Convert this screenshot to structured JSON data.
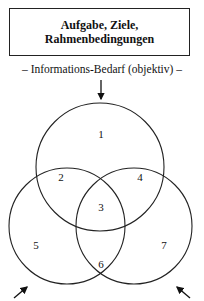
{
  "header_box": {
    "line1": "Aufgabe, Ziele,",
    "line2": "Rahmenbedingungen"
  },
  "subtitle": "– Informations-Bedarf (objektiv) –",
  "venn": {
    "regions": [
      "1",
      "2",
      "3",
      "4",
      "5",
      "6",
      "7"
    ],
    "circles": [
      "top",
      "left",
      "right"
    ],
    "arrows": [
      "top-down",
      "bottom-left",
      "bottom-right"
    ]
  }
}
